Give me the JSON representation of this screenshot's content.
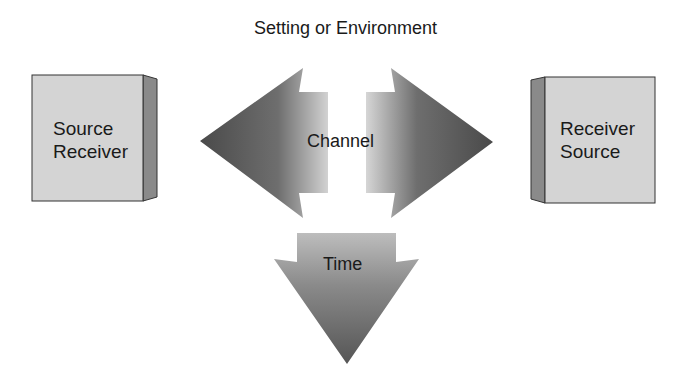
{
  "diagram": {
    "title": "Setting or Environment",
    "left_box": {
      "line1": "Source",
      "line2": "Receiver"
    },
    "right_box": {
      "line1": "Receiver",
      "line2": "Source"
    },
    "channel_label": "Channel",
    "time_label": "Time"
  },
  "colors": {
    "box_face": "#d4d4d4",
    "box_side": "#8a8a8a",
    "arrow_dark": "#4a4a4a",
    "arrow_light": "#d8d8d8",
    "text": "#1a1a1a"
  }
}
